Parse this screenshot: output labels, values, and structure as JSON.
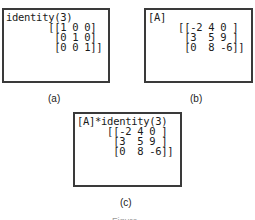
{
  "panels": {
    "a": {
      "caption": "(a)",
      "lines": [
        "identity(3)",
        "       [[1 0 0]",
        "        [0 1 0]",
        "        [0 0 1]]"
      ]
    },
    "b": {
      "caption": "(b)",
      "lines": [
        "[A]",
        "     [[-2 4 0 ]",
        "      [3  5 9 ]",
        "      [0  8 -6]]"
      ]
    },
    "c": {
      "caption": "(c)",
      "lines": [
        "[A]*identity(3)",
        "     [[-2 4 0 ]",
        "      [3  5 9 ]",
        "      [0  8 -6]]"
      ]
    }
  },
  "figure_label": "Figure"
}
